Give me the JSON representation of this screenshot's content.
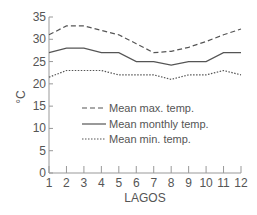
{
  "chart_data": {
    "type": "line",
    "title": "",
    "xlabel": "LAGOS",
    "ylabel": "°C",
    "x": [
      1,
      2,
      3,
      4,
      5,
      6,
      7,
      8,
      9,
      10,
      11,
      12
    ],
    "x_tick_labels": [
      "1",
      "2",
      "3",
      "4",
      "5",
      "6",
      "7",
      "8",
      "9",
      "10",
      "11",
      "12"
    ],
    "y_tick_labels": [
      "0",
      "5",
      "10",
      "15",
      "20",
      "25",
      "30",
      "35"
    ],
    "ylim": [
      0,
      35
    ],
    "xlim": [
      1,
      12
    ],
    "grid": false,
    "legend_position": "center-left inside",
    "series": [
      {
        "name": "Mean max. temp.",
        "style": "dashed",
        "values": [
          31,
          33,
          33,
          32,
          31,
          29,
          27,
          27.3,
          28.2,
          29.5,
          31,
          32.3
        ]
      },
      {
        "name": "Mean monthly temp.",
        "style": "solid",
        "values": [
          27,
          28,
          28,
          27,
          27,
          25,
          25,
          24.2,
          25,
          25,
          27,
          27
        ]
      },
      {
        "name": "Mean min. temp.",
        "style": "dotted",
        "values": [
          21.5,
          23,
          23,
          23,
          22,
          22,
          22,
          21,
          22,
          22,
          23,
          22
        ]
      }
    ],
    "colors": {
      "line": "#555555",
      "axis": "#999999",
      "text": "#555555"
    }
  }
}
